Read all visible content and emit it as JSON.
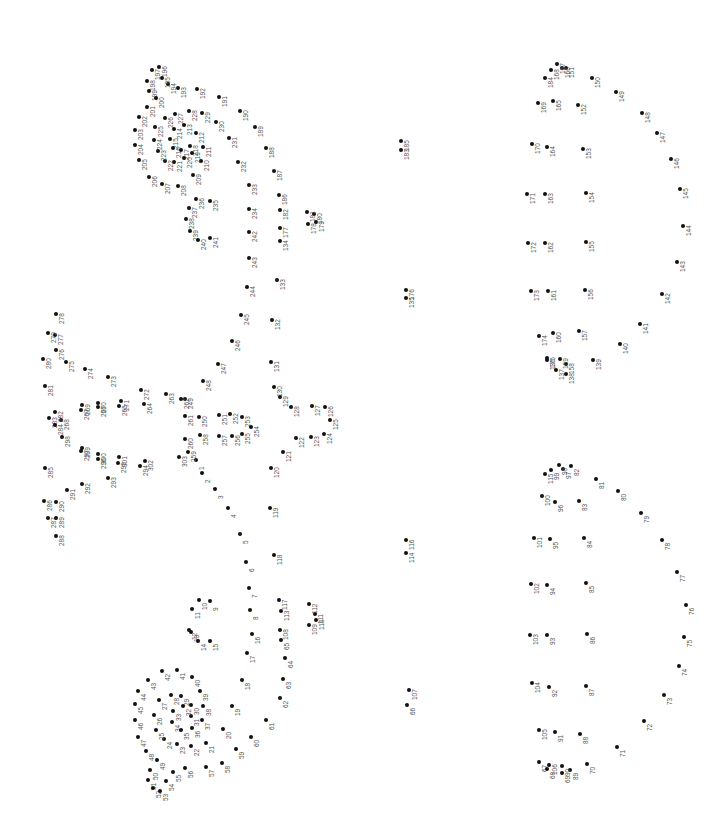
{
  "page": {
    "type": "connect-the-dots puzzle",
    "orientation": "rotated 90deg",
    "dot_color": "#111111",
    "label_color": "#555555"
  },
  "dots": [
    {
      "n": "1",
      "x": 196,
      "y": 460
    },
    {
      "n": "2",
      "x": 202,
      "y": 473
    },
    {
      "n": "3",
      "x": 215,
      "y": 489
    },
    {
      "n": "4",
      "x": 228,
      "y": 508
    },
    {
      "n": "5",
      "x": 240,
      "y": 534
    },
    {
      "n": "6",
      "x": 246,
      "y": 562
    },
    {
      "n": "7",
      "x": 249,
      "y": 588
    },
    {
      "n": "8",
      "x": 250,
      "y": 610
    },
    {
      "n": "9",
      "x": 210,
      "y": 601
    },
    {
      "n": "10",
      "x": 199,
      "y": 600
    },
    {
      "n": "11",
      "x": 192,
      "y": 609
    },
    {
      "n": "12",
      "x": 189,
      "y": 630
    },
    {
      "n": "13",
      "x": 191,
      "y": 632
    },
    {
      "n": "14",
      "x": 198,
      "y": 641
    },
    {
      "n": "15",
      "x": 210,
      "y": 641
    },
    {
      "n": "16",
      "x": 252,
      "y": 634
    },
    {
      "n": "17",
      "x": 247,
      "y": 653
    },
    {
      "n": "18",
      "x": 242,
      "y": 680
    },
    {
      "n": "19",
      "x": 232,
      "y": 706
    },
    {
      "n": "20",
      "x": 223,
      "y": 729
    },
    {
      "n": "21",
      "x": 206,
      "y": 743
    },
    {
      "n": "22",
      "x": 191,
      "y": 746
    },
    {
      "n": "23",
      "x": 177,
      "y": 744
    },
    {
      "n": "24",
      "x": 164,
      "y": 739
    },
    {
      "n": "25",
      "x": 156,
      "y": 730
    },
    {
      "n": "26",
      "x": 154,
      "y": 715
    },
    {
      "n": "27",
      "x": 159,
      "y": 700
    },
    {
      "n": "28",
      "x": 171,
      "y": 695
    },
    {
      "n": "29",
      "x": 181,
      "y": 696
    },
    {
      "n": "30",
      "x": 191,
      "y": 705
    },
    {
      "n": "31",
      "x": 191,
      "y": 716
    },
    {
      "n": "32",
      "x": 183,
      "y": 706
    },
    {
      "n": "33",
      "x": 173,
      "y": 711
    },
    {
      "n": "34",
      "x": 172,
      "y": 722
    },
    {
      "n": "35",
      "x": 181,
      "y": 730
    },
    {
      "n": "36",
      "x": 192,
      "y": 728
    },
    {
      "n": "37",
      "x": 202,
      "y": 720
    },
    {
      "n": "38",
      "x": 203,
      "y": 706
    },
    {
      "n": "39",
      "x": 200,
      "y": 691
    },
    {
      "n": "40",
      "x": 192,
      "y": 677
    },
    {
      "n": "41",
      "x": 177,
      "y": 670
    },
    {
      "n": "42",
      "x": 162,
      "y": 671
    },
    {
      "n": "43",
      "x": 148,
      "y": 680
    },
    {
      "n": "44",
      "x": 138,
      "y": 691
    },
    {
      "n": "45",
      "x": 135,
      "y": 704
    },
    {
      "n": "46",
      "x": 135,
      "y": 720
    },
    {
      "n": "47",
      "x": 138,
      "y": 737
    },
    {
      "n": "48",
      "x": 146,
      "y": 751
    },
    {
      "n": "49",
      "x": 157,
      "y": 760
    },
    {
      "n": "50",
      "x": 150,
      "y": 770
    },
    {
      "n": "51",
      "x": 148,
      "y": 780
    },
    {
      "n": "52",
      "x": 153,
      "y": 788
    },
    {
      "n": "53",
      "x": 160,
      "y": 791
    },
    {
      "n": "54",
      "x": 166,
      "y": 781
    },
    {
      "n": "55",
      "x": 173,
      "y": 772
    },
    {
      "n": "56",
      "x": 185,
      "y": 768
    },
    {
      "n": "57",
      "x": 206,
      "y": 767
    },
    {
      "n": "58",
      "x": 222,
      "y": 763
    },
    {
      "n": "59",
      "x": 236,
      "y": 749
    },
    {
      "n": "60",
      "x": 251,
      "y": 737
    },
    {
      "n": "61",
      "x": 266,
      "y": 720
    },
    {
      "n": "62",
      "x": 280,
      "y": 698
    },
    {
      "n": "63",
      "x": 283,
      "y": 679
    },
    {
      "n": "64",
      "x": 285,
      "y": 658
    },
    {
      "n": "65",
      "x": 281,
      "y": 640
    },
    {
      "n": "66",
      "x": 407,
      "y": 705
    },
    {
      "n": "67",
      "x": 539,
      "y": 762
    },
    {
      "n": "68",
      "x": 547,
      "y": 769
    },
    {
      "n": "69",
      "x": 562,
      "y": 773
    },
    {
      "n": "70",
      "x": 587,
      "y": 764
    },
    {
      "n": "71",
      "x": 617,
      "y": 747
    },
    {
      "n": "72",
      "x": 644,
      "y": 721
    },
    {
      "n": "73",
      "x": 664,
      "y": 695
    },
    {
      "n": "74",
      "x": 679,
      "y": 666
    },
    {
      "n": "75",
      "x": 684,
      "y": 637
    },
    {
      "n": "76",
      "x": 686,
      "y": 605
    },
    {
      "n": "77",
      "x": 677,
      "y": 572
    },
    {
      "n": "78",
      "x": 662,
      "y": 540
    },
    {
      "n": "79",
      "x": 641,
      "y": 513
    },
    {
      "n": "80",
      "x": 618,
      "y": 491
    },
    {
      "n": "81",
      "x": 596,
      "y": 479
    },
    {
      "n": "82",
      "x": 571,
      "y": 466
    },
    {
      "n": "83",
      "x": 579,
      "y": 501
    },
    {
      "n": "84",
      "x": 584,
      "y": 538
    },
    {
      "n": "85",
      "x": 586,
      "y": 583
    },
    {
      "n": "86",
      "x": 587,
      "y": 634
    },
    {
      "n": "87",
      "x": 586,
      "y": 686
    },
    {
      "n": "88",
      "x": 580,
      "y": 734
    },
    {
      "n": "89",
      "x": 570,
      "y": 770
    },
    {
      "n": "90",
      "x": 562,
      "y": 766
    },
    {
      "n": "91",
      "x": 555,
      "y": 732
    },
    {
      "n": "92",
      "x": 549,
      "y": 687
    },
    {
      "n": "93",
      "x": 547,
      "y": 635
    },
    {
      "n": "94",
      "x": 547,
      "y": 585
    },
    {
      "n": "95",
      "x": 550,
      "y": 539
    },
    {
      "n": "96",
      "x": 555,
      "y": 502
    },
    {
      "n": "97",
      "x": 563,
      "y": 469
    },
    {
      "n": "98",
      "x": 559,
      "y": 465
    },
    {
      "n": "99",
      "x": 551,
      "y": 470
    },
    {
      "n": "100",
      "x": 542,
      "y": 496
    },
    {
      "n": "101",
      "x": 534,
      "y": 538
    },
    {
      "n": "102",
      "x": 531,
      "y": 584
    },
    {
      "n": "103",
      "x": 530,
      "y": 635
    },
    {
      "n": "104",
      "x": 532,
      "y": 683
    },
    {
      "n": "105",
      "x": 539,
      "y": 730
    },
    {
      "n": "106",
      "x": 549,
      "y": 765
    },
    {
      "n": "107",
      "x": 409,
      "y": 690
    },
    {
      "n": "108",
      "x": 280,
      "y": 630
    },
    {
      "n": "109",
      "x": 309,
      "y": 625
    },
    {
      "n": "110",
      "x": 316,
      "y": 620
    },
    {
      "n": "111",
      "x": 315,
      "y": 614
    },
    {
      "n": "112",
      "x": 309,
      "y": 604
    },
    {
      "n": "113",
      "x": 281,
      "y": 611
    },
    {
      "n": "114",
      "x": 406,
      "y": 553
    },
    {
      "n": "115",
      "x": 545,
      "y": 474
    },
    {
      "n": "116",
      "x": 406,
      "y": 540
    },
    {
      "n": "117",
      "x": 279,
      "y": 600
    },
    {
      "n": "118",
      "x": 274,
      "y": 555
    },
    {
      "n": "119",
      "x": 270,
      "y": 508
    },
    {
      "n": "120",
      "x": 271,
      "y": 468
    },
    {
      "n": "121",
      "x": 283,
      "y": 452
    },
    {
      "n": "122",
      "x": 296,
      "y": 438
    },
    {
      "n": "123",
      "x": 311,
      "y": 437
    },
    {
      "n": "124",
      "x": 324,
      "y": 434
    },
    {
      "n": "125",
      "x": 330,
      "y": 420
    },
    {
      "n": "126",
      "x": 325,
      "y": 407
    },
    {
      "n": "127",
      "x": 312,
      "y": 406
    },
    {
      "n": "128",
      "x": 291,
      "y": 407
    },
    {
      "n": "129",
      "x": 280,
      "y": 397
    },
    {
      "n": "130",
      "x": 274,
      "y": 387
    },
    {
      "n": "131",
      "x": 271,
      "y": 362
    },
    {
      "n": "132",
      "x": 272,
      "y": 320
    },
    {
      "n": "133",
      "x": 277,
      "y": 280
    },
    {
      "n": "134",
      "x": 280,
      "y": 241
    },
    {
      "n": "135",
      "x": 406,
      "y": 298
    },
    {
      "n": "136",
      "x": 547,
      "y": 360
    },
    {
      "n": "137",
      "x": 556,
      "y": 370
    },
    {
      "n": "138",
      "x": 566,
      "y": 374
    },
    {
      "n": "139",
      "x": 593,
      "y": 360
    },
    {
      "n": "140",
      "x": 620,
      "y": 344
    },
    {
      "n": "141",
      "x": 640,
      "y": 324
    },
    {
      "n": "142",
      "x": 662,
      "y": 294
    },
    {
      "n": "143",
      "x": 677,
      "y": 262
    },
    {
      "n": "144",
      "x": 683,
      "y": 226
    },
    {
      "n": "145",
      "x": 680,
      "y": 189
    },
    {
      "n": "146",
      "x": 671,
      "y": 159
    },
    {
      "n": "147",
      "x": 657,
      "y": 133
    },
    {
      "n": "148",
      "x": 642,
      "y": 113
    },
    {
      "n": "149",
      "x": 616,
      "y": 92
    },
    {
      "n": "150",
      "x": 592,
      "y": 78
    },
    {
      "n": "151",
      "x": 566,
      "y": 68
    },
    {
      "n": "152",
      "x": 578,
      "y": 105
    },
    {
      "n": "153",
      "x": 583,
      "y": 149
    },
    {
      "n": "154",
      "x": 586,
      "y": 193
    },
    {
      "n": "155",
      "x": 586,
      "y": 242
    },
    {
      "n": "156",
      "x": 585,
      "y": 290
    },
    {
      "n": "157",
      "x": 579,
      "y": 331
    },
    {
      "n": "158",
      "x": 566,
      "y": 364
    },
    {
      "n": "159",
      "x": 560,
      "y": 359
    },
    {
      "n": "160",
      "x": 553,
      "y": 333
    },
    {
      "n": "161",
      "x": 548,
      "y": 291
    },
    {
      "n": "162",
      "x": 545,
      "y": 243
    },
    {
      "n": "163",
      "x": 545,
      "y": 194
    },
    {
      "n": "164",
      "x": 547,
      "y": 147
    },
    {
      "n": "165",
      "x": 553,
      "y": 101
    },
    {
      "n": "166",
      "x": 562,
      "y": 68
    },
    {
      "n": "167",
      "x": 557,
      "y": 64
    },
    {
      "n": "168",
      "x": 551,
      "y": 70
    },
    {
      "n": "169",
      "x": 538,
      "y": 103
    },
    {
      "n": "170",
      "x": 532,
      "y": 144
    },
    {
      "n": "171",
      "x": 527,
      "y": 194
    },
    {
      "n": "172",
      "x": 528,
      "y": 243
    },
    {
      "n": "173",
      "x": 531,
      "y": 291
    },
    {
      "n": "174",
      "x": 539,
      "y": 336
    },
    {
      "n": "175",
      "x": 547,
      "y": 358
    },
    {
      "n": "176",
      "x": 406,
      "y": 290
    },
    {
      "n": "177",
      "x": 280,
      "y": 228
    },
    {
      "n": "178",
      "x": 308,
      "y": 224
    },
    {
      "n": "179",
      "x": 316,
      "y": 222
    },
    {
      "n": "180",
      "x": 314,
      "y": 214
    },
    {
      "n": "181",
      "x": 307,
      "y": 212
    },
    {
      "n": "182",
      "x": 280,
      "y": 210
    },
    {
      "n": "183",
      "x": 401,
      "y": 150
    },
    {
      "n": "184",
      "x": 545,
      "y": 78
    },
    {
      "n": "185",
      "x": 401,
      "y": 141
    },
    {
      "n": "186",
      "x": 279,
      "y": 195
    },
    {
      "n": "187",
      "x": 274,
      "y": 171
    },
    {
      "n": "188",
      "x": 266,
      "y": 148
    },
    {
      "n": "189",
      "x": 255,
      "y": 127
    },
    {
      "n": "190",
      "x": 240,
      "y": 111
    },
    {
      "n": "191",
      "x": 219,
      "y": 97
    },
    {
      "n": "192",
      "x": 197,
      "y": 89
    },
    {
      "n": "193",
      "x": 178,
      "y": 88
    },
    {
      "n": "194",
      "x": 168,
      "y": 84
    },
    {
      "n": "195",
      "x": 162,
      "y": 78
    },
    {
      "n": "196",
      "x": 159,
      "y": 67
    },
    {
      "n": "197",
      "x": 152,
      "y": 70
    },
    {
      "n": "198",
      "x": 147,
      "y": 81
    },
    {
      "n": "199",
      "x": 149,
      "y": 91
    },
    {
      "n": "200",
      "x": 156,
      "y": 98
    },
    {
      "n": "201",
      "x": 147,
      "y": 107
    },
    {
      "n": "202",
      "x": 139,
      "y": 117
    },
    {
      "n": "203",
      "x": 135,
      "y": 130
    },
    {
      "n": "204",
      "x": 135,
      "y": 145
    },
    {
      "n": "205",
      "x": 139,
      "y": 160
    },
    {
      "n": "206",
      "x": 149,
      "y": 177
    },
    {
      "n": "207",
      "x": 162,
      "y": 184
    },
    {
      "n": "208",
      "x": 178,
      "y": 186
    },
    {
      "n": "209",
      "x": 193,
      "y": 175
    },
    {
      "n": "210",
      "x": 201,
      "y": 161
    },
    {
      "n": "211",
      "x": 203,
      "y": 147
    },
    {
      "n": "212",
      "x": 196,
      "y": 133
    },
    {
      "n": "213",
      "x": 184,
      "y": 125
    },
    {
      "n": "214",
      "x": 174,
      "y": 129
    },
    {
      "n": "215",
      "x": 170,
      "y": 139
    },
    {
      "n": "216",
      "x": 173,
      "y": 148
    },
    {
      "n": "217",
      "x": 181,
      "y": 150
    },
    {
      "n": "218",
      "x": 190,
      "y": 146
    },
    {
      "n": "219",
      "x": 192,
      "y": 153
    },
    {
      "n": "220",
      "x": 184,
      "y": 158
    },
    {
      "n": "221",
      "x": 174,
      "y": 162
    },
    {
      "n": "222",
      "x": 165,
      "y": 161
    },
    {
      "n": "223",
      "x": 158,
      "y": 151
    },
    {
      "n": "224",
      "x": 154,
      "y": 140
    },
    {
      "n": "225",
      "x": 155,
      "y": 127
    },
    {
      "n": "226",
      "x": 165,
      "y": 118
    },
    {
      "n": "227",
      "x": 175,
      "y": 114
    },
    {
      "n": "228",
      "x": 189,
      "y": 111
    },
    {
      "n": "229",
      "x": 202,
      "y": 113
    },
    {
      "n": "230",
      "x": 216,
      "y": 122
    },
    {
      "n": "231",
      "x": 229,
      "y": 138
    },
    {
      "n": "232",
      "x": 238,
      "y": 162
    },
    {
      "n": "233",
      "x": 249,
      "y": 185
    },
    {
      "n": "234",
      "x": 249,
      "y": 209
    },
    {
      "n": "235",
      "x": 210,
      "y": 201
    },
    {
      "n": "236",
      "x": 196,
      "y": 199
    },
    {
      "n": "237",
      "x": 189,
      "y": 208
    },
    {
      "n": "238",
      "x": 186,
      "y": 219
    },
    {
      "n": "239",
      "x": 190,
      "y": 231
    },
    {
      "n": "240",
      "x": 198,
      "y": 240
    },
    {
      "n": "241",
      "x": 210,
      "y": 238
    },
    {
      "n": "242",
      "x": 249,
      "y": 232
    },
    {
      "n": "243",
      "x": 249,
      "y": 258
    },
    {
      "n": "244",
      "x": 247,
      "y": 287
    },
    {
      "n": "245",
      "x": 241,
      "y": 315
    },
    {
      "n": "246",
      "x": 232,
      "y": 341
    },
    {
      "n": "247",
      "x": 218,
      "y": 364
    },
    {
      "n": "248",
      "x": 203,
      "y": 381
    },
    {
      "n": "249",
      "x": 185,
      "y": 399
    },
    {
      "n": "250",
      "x": 199,
      "y": 417
    },
    {
      "n": "251",
      "x": 219,
      "y": 415
    },
    {
      "n": "252",
      "x": 230,
      "y": 414
    },
    {
      "n": "253",
      "x": 242,
      "y": 417
    },
    {
      "n": "254",
      "x": 251,
      "y": 427
    },
    {
      "n": "255",
      "x": 242,
      "y": 434
    },
    {
      "n": "256",
      "x": 232,
      "y": 436
    },
    {
      "n": "257",
      "x": 219,
      "y": 436
    },
    {
      "n": "258",
      "x": 200,
      "y": 435
    },
    {
      "n": "259",
      "x": 188,
      "y": 452
    },
    {
      "n": "260",
      "x": 185,
      "y": 439
    },
    {
      "n": "261",
      "x": 185,
      "y": 416
    },
    {
      "n": "262",
      "x": 181,
      "y": 399
    },
    {
      "n": "263",
      "x": 166,
      "y": 394
    },
    {
      "n": "264",
      "x": 144,
      "y": 404
    },
    {
      "n": "265",
      "x": 119,
      "y": 406
    },
    {
      "n": "266",
      "x": 98,
      "y": 407
    },
    {
      "n": "267",
      "x": 81,
      "y": 410
    },
    {
      "n": "268",
      "x": 61,
      "y": 420
    },
    {
      "n": "269",
      "x": 82,
      "y": 405
    },
    {
      "n": "270",
      "x": 98,
      "y": 403
    },
    {
      "n": "271",
      "x": 121,
      "y": 401
    },
    {
      "n": "272",
      "x": 141,
      "y": 390
    },
    {
      "n": "273",
      "x": 108,
      "y": 377
    },
    {
      "n": "274",
      "x": 85,
      "y": 369
    },
    {
      "n": "275",
      "x": 66,
      "y": 362
    },
    {
      "n": "276",
      "x": 56,
      "y": 350
    },
    {
      "n": "277",
      "x": 55,
      "y": 335
    },
    {
      "n": "278",
      "x": 56,
      "y": 314
    },
    {
      "n": "279",
      "x": 48,
      "y": 333
    },
    {
      "n": "280",
      "x": 43,
      "y": 359
    },
    {
      "n": "281",
      "x": 45,
      "y": 386
    },
    {
      "n": "282",
      "x": 55,
      "y": 412
    },
    {
      "n": "283",
      "x": 49,
      "y": 418
    },
    {
      "n": "284",
      "x": 55,
      "y": 425
    },
    {
      "n": "285",
      "x": 45,
      "y": 468
    },
    {
      "n": "286",
      "x": 44,
      "y": 501
    },
    {
      "n": "287",
      "x": 48,
      "y": 518
    },
    {
      "n": "288",
      "x": 56,
      "y": 536
    },
    {
      "n": "289",
      "x": 56,
      "y": 518
    },
    {
      "n": "290",
      "x": 56,
      "y": 502
    },
    {
      "n": "291",
      "x": 67,
      "y": 490
    },
    {
      "n": "292",
      "x": 82,
      "y": 484
    },
    {
      "n": "293",
      "x": 108,
      "y": 478
    },
    {
      "n": "294",
      "x": 140,
      "y": 466
    },
    {
      "n": "295",
      "x": 118,
      "y": 463
    },
    {
      "n": "296",
      "x": 98,
      "y": 459
    },
    {
      "n": "297",
      "x": 81,
      "y": 451
    },
    {
      "n": "298",
      "x": 62,
      "y": 437
    },
    {
      "n": "299",
      "x": 82,
      "y": 448
    },
    {
      "n": "300",
      "x": 98,
      "y": 454
    },
    {
      "n": "301",
      "x": 119,
      "y": 457
    },
    {
      "n": "302",
      "x": 145,
      "y": 461
    },
    {
      "n": "303",
      "x": 179,
      "y": 457
    }
  ]
}
